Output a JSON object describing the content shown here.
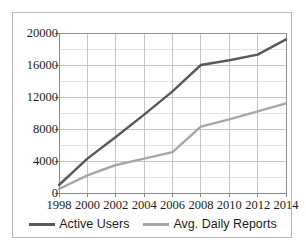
{
  "chart_data": {
    "type": "line",
    "title": "",
    "subtitle": "",
    "xlabel": "",
    "ylabel": "",
    "x": [
      1998,
      2000,
      2002,
      2004,
      2006,
      2008,
      2010,
      2012,
      2014
    ],
    "x_tick_labels": [
      "1998",
      "2000",
      "2002",
      "2004",
      "2006",
      "2008",
      "2010",
      "2012",
      "2014"
    ],
    "y_tick_labels": [
      "0",
      "4000",
      "8000",
      "12000",
      "16000",
      "20000"
    ],
    "y_tick_values": [
      0,
      4000,
      8000,
      12000,
      16000,
      20000
    ],
    "ylim": [
      0,
      20000
    ],
    "xlim": [
      1998,
      2014
    ],
    "minor_gridline_step": 2000,
    "grid": true,
    "grid_color": "#bfbfbf",
    "minor_grid_color": "#d9d9d9",
    "legend_position": "bottom",
    "series": [
      {
        "name": "Active Users",
        "color": "#595959",
        "values": [
          1000,
          4300,
          7000,
          9800,
          12700,
          16000,
          16600,
          17300,
          19200
        ]
      },
      {
        "name": "Avg. Daily Reports",
        "color": "#a6a6a6",
        "values": [
          500,
          2200,
          3500,
          4300,
          5100,
          8300,
          9200,
          10200,
          11200
        ]
      }
    ]
  },
  "frame": {
    "border_color": "#b9b9b9",
    "background": "#ffffff"
  }
}
